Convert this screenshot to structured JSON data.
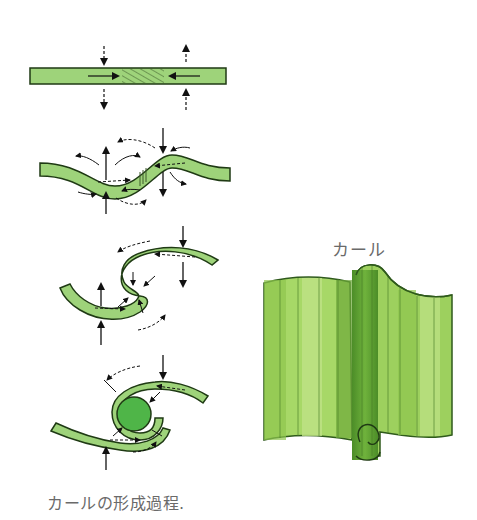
{
  "figure": {
    "caption": "カールの形成過程.",
    "curl_label": "カール",
    "stages": [
      {
        "id": 1,
        "description": "flat sheet with compressive forces and hatched zone"
      },
      {
        "id": 2,
        "description": "sheet beginning to buckle with force arrows"
      },
      {
        "id": 3,
        "description": "S-shaped fold"
      },
      {
        "id": 4,
        "description": "curl formed around core"
      }
    ],
    "colors": {
      "sheet_fill": "#9ed37a",
      "sheet_stroke": "#1f3a14",
      "core_fill": "#4fb548",
      "curl_light": "#b7e07c",
      "curl_mid": "#8cc84a",
      "curl_dark": "#5fa032",
      "text": "#6a6a6a"
    }
  }
}
